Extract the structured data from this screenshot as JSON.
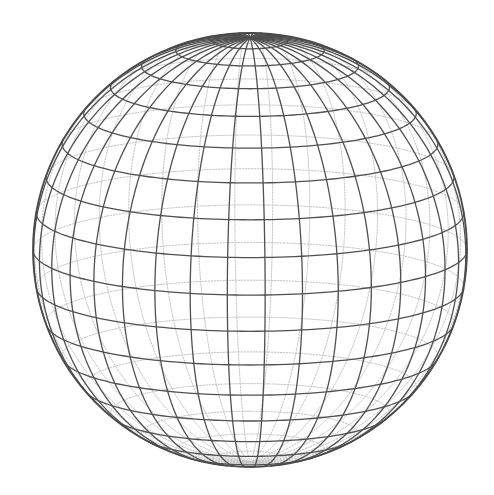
{
  "figure": {
    "type": "wireframe-sphere",
    "width": 494,
    "height": 495,
    "background": "#ffffff",
    "sphere": {
      "center_x": 250,
      "center_y": 250,
      "radius": 217,
      "tilt_deg": 12,
      "rotation_deg": 4,
      "meridian_step_deg": 10,
      "parallel_step_deg": 10
    },
    "style": {
      "front_color": "#505050",
      "front_width": 1.3,
      "back_color": "#c4c4c4",
      "back_width": 1.0,
      "back_dash": "1.5,1.5",
      "outline_color": "#4a4a4a",
      "outline_width": 1.8
    }
  }
}
